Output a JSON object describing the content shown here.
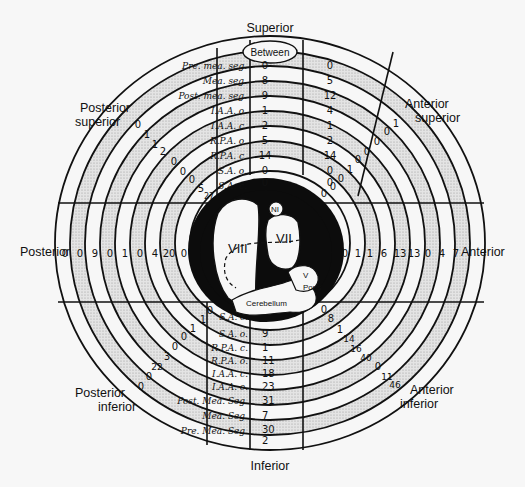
{
  "directions": {
    "superior": "Superior",
    "inferior": "Inferior",
    "posterior": "Posterior",
    "anterior": "Anterior",
    "posterior_superior": [
      "Posterior",
      "superior"
    ],
    "anterior_superior": [
      "Anterior",
      "superior"
    ],
    "posterior_inferior": [
      "Posterior",
      "inferior"
    ],
    "anterior_inferior": [
      "Anterior",
      "inferior"
    ]
  },
  "between_label": "Between",
  "superior_table": {
    "rows": [
      {
        "label": "Pre. mea. seg.",
        "left": "0",
        "right": "0"
      },
      {
        "label": "Mea. seg.",
        "left": "8",
        "right": "5"
      },
      {
        "label": "Post. mea. seg.",
        "left": "9",
        "right": "12"
      },
      {
        "label": "I.A.A. o.",
        "left": "1",
        "right": "4"
      },
      {
        "label": "I.A.A. c.",
        "left": "2",
        "right": "1"
      },
      {
        "label": "R.P.A. o.",
        "left": "5",
        "right": "2"
      },
      {
        "label": "R.P.A. c.",
        "left": "14",
        "right": "14"
      },
      {
        "label": "S.A. o.",
        "left": "0",
        "right": "0"
      },
      {
        "label": "S.A. c.",
        "left": "0",
        "right": "0"
      }
    ]
  },
  "inferior_table": {
    "rows": [
      {
        "label": "S.A. c.",
        "value": "9"
      },
      {
        "label": "S.A. o.",
        "value": "1"
      },
      {
        "label": "R.P.A. c.",
        "value": "11"
      },
      {
        "label": "R.P.A. o.",
        "value": "18"
      },
      {
        "label": "I.A.A. c.",
        "value": "23"
      },
      {
        "label": "I.A.A. o.",
        "value": "31"
      },
      {
        "label": "Post. Mea. Seg.",
        "value": "7"
      },
      {
        "label": "Mea. Seg.",
        "value": "30"
      },
      {
        "label": "Pre. Mea. Seg.",
        "value": "2"
      }
    ]
  },
  "posterior_values": [
    "0",
    "0",
    "9",
    "0",
    "1",
    "0",
    "4",
    "20",
    "0"
  ],
  "anterior_values": [
    "0",
    "1",
    "1",
    "6",
    "13",
    "13",
    "0",
    "4",
    "7"
  ],
  "posterior_superior_values": [
    "0",
    "1",
    "1",
    "2",
    "0",
    "0",
    "0",
    "5",
    "27"
  ],
  "anterior_superior_values": [
    "0",
    "0",
    "0",
    "1",
    "0",
    "0",
    "0",
    "0",
    "1"
  ],
  "posterior_inferior_values": [
    "0",
    "1",
    "1",
    "0",
    "0",
    "3",
    "22",
    "0",
    "0"
  ],
  "anterior_inferior_values": [
    "0",
    "8",
    "1",
    "14",
    "16",
    "40",
    "0",
    "11",
    "46"
  ],
  "center": {
    "nerve_labels": {
      "viii": "VIII",
      "vii": "VII",
      "ni": "NI",
      "v": "V",
      "pons": "Pons",
      "cerebellum": "Cerebellum"
    }
  },
  "colors": {
    "background": "#f7f7f7",
    "ink": "#111111",
    "shaded_band": "#cfcfcf"
  }
}
